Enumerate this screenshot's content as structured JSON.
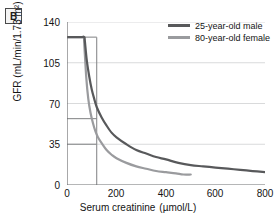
{
  "panel": {
    "label": "B"
  },
  "axes": {
    "y_label": "GFR (mL/min/1.73 m²)",
    "x_label": "Serum creatinine",
    "x_unit": "(µmol/L)",
    "y_ticks": [
      "140",
      "105",
      "70",
      "35",
      "0"
    ],
    "x_ticks": [
      "0",
      "200",
      "400",
      "600",
      "800"
    ]
  },
  "legend": {
    "items": [
      {
        "label": "25-year-old male",
        "color": "#58595b"
      },
      {
        "label": "80-year-old female",
        "color": "#9a9b9e"
      }
    ]
  },
  "colors": {
    "axis": "#6d6e70",
    "gridline": "#d9dadb",
    "reference_line": "#8a8b8d",
    "series_dark": "#58595b",
    "series_light": "#9a9b9e",
    "text": "#141414",
    "background": "#ffffff"
  },
  "chart_data": {
    "type": "line",
    "title": "",
    "xlabel": "Serum creatinine (µmol/L)",
    "ylabel": "GFR (mL/min/1.73 m²)",
    "xlim": [
      0,
      800
    ],
    "ylim": [
      0,
      140
    ],
    "xticks": [
      0,
      200,
      400,
      600,
      800
    ],
    "yticks": [
      0,
      35,
      70,
      105,
      140
    ],
    "grid": "horizontal",
    "legend_position": "top-right",
    "annotations": {
      "reference_vertical_x": 120,
      "reference_horizontal_y_male": 57,
      "reference_horizontal_y_female": 35,
      "plateau_gfr": 127
    },
    "series": [
      {
        "name": "25-year-old male",
        "color": "#58595b",
        "x": [
          0,
          40,
          60,
          70,
          72,
          80,
          90,
          100,
          110,
          120,
          140,
          160,
          180,
          200,
          240,
          280,
          320,
          360,
          400,
          450,
          500,
          550,
          600,
          650,
          700,
          750,
          800
        ],
        "y": [
          127,
          127,
          127,
          127,
          124,
          107,
          93,
          82,
          74,
          67,
          58,
          51,
          45,
          41,
          35,
          30,
          27,
          24,
          22,
          19,
          17,
          16,
          15,
          14,
          13,
          12,
          11
        ]
      },
      {
        "name": "80-year-old female",
        "color": "#9a9b9e",
        "x": [
          0,
          40,
          60,
          68,
          70,
          78,
          86,
          95,
          105,
          115,
          125,
          140,
          160,
          180,
          200,
          240,
          280,
          320,
          360,
          400,
          440,
          470,
          500
        ],
        "y": [
          127,
          127,
          127,
          127,
          120,
          92,
          74,
          62,
          53,
          46,
          41,
          36,
          30,
          26,
          23,
          19,
          16,
          14,
          12,
          11,
          10,
          9,
          9
        ]
      }
    ]
  }
}
